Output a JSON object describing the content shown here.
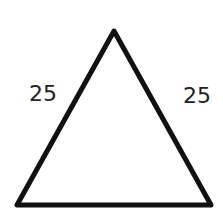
{
  "diagram": {
    "shape": "isosceles-triangle",
    "stroke_color": "#111111",
    "side_labels": {
      "left": "25",
      "right": "25"
    }
  }
}
